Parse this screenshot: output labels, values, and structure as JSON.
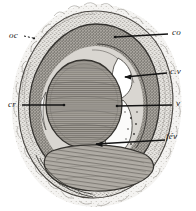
{
  "figure": {
    "kind": "engraving-cross-section",
    "background_color": "#ffffff",
    "ink_color": "#1a1a1a",
    "tone_light": "#e8e6e2",
    "tone_mid": "#b9b5ae",
    "tone_dark": "#8e8a84",
    "tone_darker": "#6f6b66"
  },
  "labels": [
    {
      "id": "oc",
      "text": "oc",
      "side": "left",
      "leader": "dashed-short"
    },
    {
      "id": "cr",
      "text": "cr",
      "side": "left",
      "leader": "solid-long"
    },
    {
      "id": "co",
      "text": "co",
      "side": "right",
      "leader": "solid-long"
    },
    {
      "id": "cv",
      "text": "c.v",
      "side": "right",
      "leader": "solid-long"
    },
    {
      "id": "v",
      "text": "v",
      "side": "right",
      "leader": "solid-long"
    },
    {
      "id": "fev",
      "text": "fév",
      "side": "right",
      "leader": "solid-long"
    }
  ]
}
